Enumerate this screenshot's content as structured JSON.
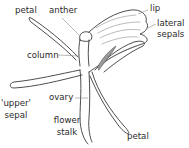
{
  "diagram": {
    "labels": {
      "petal_top": "petal",
      "anther": "anther",
      "lip": "lip",
      "lateral_sepals_line1": "lateral",
      "lateral_sepals_line2": "sepals",
      "column": "column",
      "upper_sepal_line1": "'upper'",
      "upper_sepal_line2": "sepal",
      "ovary": "ovary",
      "flower_stalk_line1": "flower",
      "flower_stalk_line2": "stalk",
      "petal_bottom": "petal"
    },
    "colors": {
      "outline": "#3a3a3a",
      "leader": "#8a8a8a",
      "shading": "#9a9a9a",
      "background": "#ffffff"
    }
  }
}
